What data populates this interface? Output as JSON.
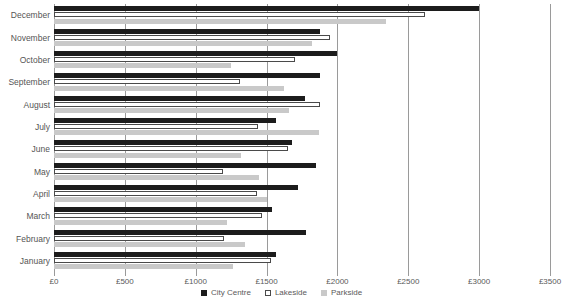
{
  "chart_data": {
    "type": "bar",
    "orientation": "horizontal",
    "title": "",
    "xlabel": "",
    "ylabel": "",
    "xlim": [
      0,
      3500
    ],
    "xtick_values": [
      0,
      500,
      1000,
      1500,
      2000,
      2500,
      3000,
      3500
    ],
    "xtick_labels": [
      "£0",
      "£500",
      "£1000",
      "£1500",
      "£2000",
      "£2500",
      "£3000",
      "£3500"
    ],
    "grid": true,
    "grid_axis": "x",
    "legend_position": "bottom",
    "categories": [
      "December",
      "November",
      "October",
      "September",
      "August",
      "July",
      "June",
      "May",
      "April",
      "March",
      "February",
      "January"
    ],
    "series": [
      {
        "name": "City Centre",
        "color": "#1c1c1c",
        "values": [
          3000,
          1880,
          2000,
          1880,
          1770,
          1570,
          1680,
          1850,
          1720,
          1540,
          1780,
          1570
        ]
      },
      {
        "name": "Lakeside",
        "color": "#ffffff",
        "values": [
          2615,
          1950,
          1700,
          1310,
          1880,
          1440,
          1650,
          1190,
          1430,
          1470,
          1200,
          1530
        ]
      },
      {
        "name": "Parkside",
        "color": "#c9c9c9",
        "values": [
          2340,
          1820,
          1250,
          1620,
          1660,
          1870,
          1320,
          1450,
          1500,
          1220,
          1350,
          1260
        ]
      }
    ]
  },
  "legend": {
    "items": [
      {
        "label": "City Centre",
        "key": "cc"
      },
      {
        "label": "Lakeside",
        "key": "ls"
      },
      {
        "label": "Parkside",
        "key": "ps"
      }
    ]
  }
}
